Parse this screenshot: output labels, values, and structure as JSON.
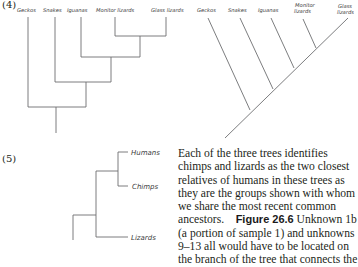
{
  "panels": {
    "panel4": {
      "number": "(4)",
      "left_tree": {
        "style": "rectangular cladogram",
        "labels": [
          "Geckos",
          "Snakes",
          "Iguanas",
          "Monitor lizards",
          "Glass lizards"
        ]
      },
      "right_tree": {
        "style": "diagonal cladogram",
        "labels": [
          "Geckos",
          "Snakes",
          "Iguanas",
          "Monitor",
          "lizards",
          "Glass",
          "lizards"
        ]
      }
    },
    "panel5": {
      "number": "(5)",
      "tree": {
        "style": "rectangular cladogram",
        "labels": [
          "Humans",
          "Chimps",
          "Lizards"
        ]
      }
    }
  },
  "paragraph": {
    "lines": [
      "Each of the three trees identifies",
      "chimps and lizards as the two closest",
      "relatives of humans in these trees as",
      "they are the groups shown with whom",
      "we share the most recent common",
      "ancestors.",
      "(a portion of sample 1) and unknowns",
      "9–13 all would have to be located on",
      "the branch of the tree that connects the"
    ],
    "figure_ref": "Figure 26.6",
    "line6_after_ref": " Unknown 1b"
  }
}
